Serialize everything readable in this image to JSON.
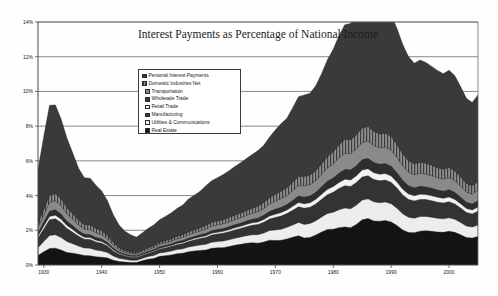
{
  "chart_data": {
    "type": "area",
    "stacked": true,
    "title": "Interest Payments as Percentage of National Income",
    "xlabel": "",
    "ylabel": "",
    "ylim": [
      0,
      14
    ],
    "xlim": [
      1929,
      2005
    ],
    "ytick_labels": [
      "0%",
      "2%",
      "4%",
      "6%",
      "8%",
      "10%",
      "12%",
      "14%"
    ],
    "ytick_values": [
      0,
      2,
      4,
      6,
      8,
      10,
      12,
      14
    ],
    "xtick_labels": [
      "1930",
      "1940",
      "1950",
      "1960",
      "1970",
      "1980",
      "1990",
      "2000"
    ],
    "xtick_values": [
      1930,
      1940,
      1950,
      1960,
      1970,
      1980,
      1990,
      2000
    ],
    "grid": "horizontal",
    "legend_position": "inside-upper-center",
    "x": [
      1929,
      1930,
      1931,
      1932,
      1933,
      1934,
      1935,
      1936,
      1937,
      1938,
      1939,
      1940,
      1941,
      1942,
      1943,
      1944,
      1945,
      1946,
      1947,
      1948,
      1949,
      1950,
      1951,
      1952,
      1953,
      1954,
      1955,
      1956,
      1957,
      1958,
      1959,
      1960,
      1961,
      1962,
      1963,
      1964,
      1965,
      1966,
      1967,
      1968,
      1969,
      1970,
      1971,
      1972,
      1973,
      1974,
      1975,
      1976,
      1977,
      1978,
      1979,
      1980,
      1981,
      1982,
      1983,
      1984,
      1985,
      1986,
      1987,
      1988,
      1989,
      1990,
      1991,
      1992,
      1993,
      1994,
      1995,
      1996,
      1997,
      1998,
      1999,
      2000,
      2001,
      2002,
      2003,
      2004,
      2005
    ],
    "series": [
      {
        "name": "Real Estate",
        "values": [
          3.1,
          4.2,
          5.2,
          5.1,
          4.6,
          4.0,
          3.5,
          3.0,
          2.7,
          2.7,
          2.5,
          2.3,
          2.0,
          1.6,
          1.3,
          1.1,
          1.0,
          0.9,
          1.0,
          1.1,
          1.2,
          1.3,
          1.4,
          1.5,
          1.6,
          1.7,
          1.9,
          2.0,
          2.1,
          2.3,
          2.4,
          2.5,
          2.6,
          2.7,
          2.8,
          2.9,
          3.0,
          3.1,
          3.2,
          3.3,
          3.5,
          3.7,
          3.9,
          4.0,
          4.3,
          4.6,
          4.7,
          4.7,
          4.9,
          5.2,
          5.6,
          5.9,
          6.3,
          6.6,
          6.7,
          6.9,
          7.1,
          7.2,
          7.1,
          7.0,
          7.1,
          7.0,
          6.7,
          6.3,
          6.0,
          5.8,
          5.9,
          5.8,
          5.7,
          5.6,
          5.5,
          5.6,
          5.5,
          5.2,
          4.9,
          4.8,
          5.0
        ]
      },
      {
        "name": "Utilities & Communications",
        "values": [
          0.25,
          0.32,
          0.4,
          0.42,
          0.4,
          0.36,
          0.32,
          0.28,
          0.26,
          0.26,
          0.24,
          0.22,
          0.19,
          0.15,
          0.12,
          0.1,
          0.09,
          0.08,
          0.09,
          0.1,
          0.11,
          0.12,
          0.13,
          0.14,
          0.15,
          0.16,
          0.17,
          0.18,
          0.19,
          0.21,
          0.22,
          0.23,
          0.24,
          0.25,
          0.26,
          0.27,
          0.28,
          0.3,
          0.32,
          0.34,
          0.36,
          0.4,
          0.43,
          0.45,
          0.48,
          0.52,
          0.55,
          0.56,
          0.58,
          0.61,
          0.65,
          0.7,
          0.75,
          0.8,
          0.8,
          0.82,
          0.84,
          0.84,
          0.82,
          0.8,
          0.8,
          0.78,
          0.74,
          0.7,
          0.66,
          0.63,
          0.63,
          0.62,
          0.6,
          0.59,
          0.58,
          0.58,
          0.56,
          0.53,
          0.5,
          0.48,
          0.5
        ]
      },
      {
        "name": "Manufacturing",
        "values": [
          0.3,
          0.4,
          0.5,
          0.52,
          0.48,
          0.42,
          0.37,
          0.32,
          0.29,
          0.29,
          0.27,
          0.25,
          0.21,
          0.17,
          0.13,
          0.11,
          0.1,
          0.09,
          0.1,
          0.11,
          0.12,
          0.13,
          0.14,
          0.15,
          0.16,
          0.18,
          0.19,
          0.2,
          0.22,
          0.24,
          0.25,
          0.26,
          0.27,
          0.28,
          0.29,
          0.31,
          0.32,
          0.34,
          0.37,
          0.4,
          0.43,
          0.47,
          0.5,
          0.52,
          0.56,
          0.61,
          0.64,
          0.65,
          0.67,
          0.71,
          0.76,
          0.82,
          0.88,
          0.94,
          0.94,
          0.96,
          0.99,
          1.0,
          0.97,
          0.95,
          0.95,
          0.93,
          0.88,
          0.83,
          0.78,
          0.75,
          0.75,
          0.74,
          0.72,
          0.7,
          0.69,
          0.7,
          0.67,
          0.63,
          0.59,
          0.57,
          0.6
        ]
      },
      {
        "name": "Retail Trade",
        "values": [
          0.18,
          0.24,
          0.3,
          0.31,
          0.29,
          0.25,
          0.22,
          0.19,
          0.17,
          0.17,
          0.16,
          0.15,
          0.13,
          0.1,
          0.08,
          0.07,
          0.06,
          0.06,
          0.06,
          0.07,
          0.07,
          0.08,
          0.09,
          0.09,
          0.1,
          0.11,
          0.11,
          0.12,
          0.13,
          0.14,
          0.15,
          0.16,
          0.16,
          0.17,
          0.18,
          0.18,
          0.19,
          0.2,
          0.22,
          0.24,
          0.26,
          0.28,
          0.3,
          0.31,
          0.34,
          0.37,
          0.38,
          0.39,
          0.4,
          0.43,
          0.46,
          0.49,
          0.53,
          0.56,
          0.57,
          0.58,
          0.6,
          0.6,
          0.58,
          0.57,
          0.57,
          0.56,
          0.53,
          0.5,
          0.47,
          0.45,
          0.45,
          0.44,
          0.43,
          0.42,
          0.41,
          0.42,
          0.4,
          0.38,
          0.35,
          0.34,
          0.36
        ]
      },
      {
        "name": "Wholesale Trade",
        "values": [
          0.12,
          0.16,
          0.2,
          0.21,
          0.19,
          0.17,
          0.15,
          0.13,
          0.11,
          0.11,
          0.1,
          0.1,
          0.08,
          0.07,
          0.05,
          0.04,
          0.04,
          0.04,
          0.04,
          0.04,
          0.05,
          0.05,
          0.06,
          0.06,
          0.07,
          0.07,
          0.08,
          0.08,
          0.09,
          0.09,
          0.1,
          0.1,
          0.11,
          0.11,
          0.12,
          0.12,
          0.13,
          0.14,
          0.15,
          0.16,
          0.17,
          0.19,
          0.2,
          0.21,
          0.23,
          0.25,
          0.26,
          0.26,
          0.27,
          0.29,
          0.31,
          0.33,
          0.35,
          0.38,
          0.38,
          0.39,
          0.4,
          0.4,
          0.39,
          0.38,
          0.38,
          0.37,
          0.35,
          0.33,
          0.31,
          0.3,
          0.3,
          0.29,
          0.29,
          0.28,
          0.27,
          0.28,
          0.27,
          0.25,
          0.24,
          0.23,
          0.24
        ]
      },
      {
        "name": "Transportation",
        "values": [
          0.55,
          0.72,
          0.9,
          0.92,
          0.86,
          0.75,
          0.66,
          0.57,
          0.51,
          0.51,
          0.47,
          0.44,
          0.37,
          0.29,
          0.23,
          0.19,
          0.17,
          0.16,
          0.17,
          0.19,
          0.21,
          0.23,
          0.24,
          0.26,
          0.28,
          0.3,
          0.32,
          0.34,
          0.37,
          0.4,
          0.42,
          0.43,
          0.45,
          0.47,
          0.48,
          0.5,
          0.52,
          0.55,
          0.58,
          0.62,
          0.66,
          0.72,
          0.76,
          0.79,
          0.84,
          0.9,
          0.93,
          0.94,
          0.97,
          1.02,
          1.08,
          1.15,
          1.22,
          1.28,
          1.28,
          1.3,
          1.33,
          1.33,
          1.29,
          1.26,
          1.26,
          1.23,
          1.16,
          1.09,
          1.03,
          0.99,
          0.99,
          0.97,
          0.95,
          0.93,
          0.91,
          0.92,
          0.88,
          0.83,
          0.78,
          0.75,
          0.79
        ]
      },
      {
        "name": "Domestic Industries Net",
        "values": [
          0.45,
          0.6,
          0.75,
          0.77,
          0.72,
          0.63,
          0.55,
          0.47,
          0.43,
          0.43,
          0.39,
          0.36,
          0.31,
          0.24,
          0.19,
          0.16,
          0.14,
          0.13,
          0.14,
          0.16,
          0.17,
          0.19,
          0.2,
          0.22,
          0.24,
          0.25,
          0.27,
          0.29,
          0.31,
          0.33,
          0.35,
          0.36,
          0.38,
          0.39,
          0.4,
          0.42,
          0.44,
          0.46,
          0.49,
          0.52,
          0.56,
          0.61,
          0.64,
          0.67,
          0.71,
          0.76,
          0.79,
          0.8,
          0.82,
          0.87,
          0.92,
          0.98,
          1.04,
          1.09,
          1.09,
          1.11,
          1.13,
          1.13,
          1.1,
          1.07,
          1.07,
          1.05,
          0.99,
          0.93,
          0.88,
          0.84,
          0.84,
          0.83,
          0.81,
          0.79,
          0.78,
          0.78,
          0.75,
          0.71,
          0.66,
          0.64,
          0.67
        ]
      },
      {
        "name": "Personal Interest Payments",
        "values": [
          0.55,
          0.76,
          0.95,
          0.97,
          0.86,
          0.72,
          0.68,
          0.62,
          0.55,
          0.53,
          0.47,
          0.45,
          0.41,
          0.28,
          0.2,
          0.17,
          0.14,
          0.14,
          0.24,
          0.33,
          0.38,
          0.5,
          0.54,
          0.58,
          0.65,
          0.68,
          0.76,
          0.81,
          0.84,
          0.86,
          0.96,
          0.99,
          1.0,
          1.06,
          1.14,
          1.19,
          1.25,
          1.28,
          1.26,
          1.32,
          1.43,
          1.41,
          1.42,
          1.5,
          1.6,
          1.69,
          1.55,
          1.59,
          1.73,
          1.9,
          2.05,
          2.06,
          2.15,
          2.19,
          2.15,
          2.34,
          2.61,
          2.68,
          2.54,
          2.52,
          2.56,
          2.48,
          2.28,
          2.02,
          1.87,
          1.86,
          1.95,
          1.97,
          1.94,
          1.9,
          1.88,
          1.94,
          1.88,
          1.74,
          1.58,
          1.55,
          1.64
        ]
      }
    ]
  },
  "legend": {
    "items": [
      {
        "label": "Personal Interest Payments",
        "swatch": "dark-solid"
      },
      {
        "label": "Domestic Industries Net",
        "swatch": "hatched"
      },
      {
        "label": "Transportation",
        "swatch": "mid-gray"
      },
      {
        "label": "Wholesale Trade",
        "swatch": "dark-solid"
      },
      {
        "label": "Retail Trade",
        "swatch": "light"
      },
      {
        "label": "Manufacturing",
        "swatch": "dark-solid"
      },
      {
        "label": "Utilities & Communications",
        "swatch": "light"
      },
      {
        "label": "Real Estate",
        "swatch": "black-solid"
      }
    ]
  },
  "colors": {
    "personal_interest_payments": "#3a3a3a",
    "domestic_industries_net": "#6e6e6e",
    "transportation": "#8a8a8a",
    "wholesale_trade": "#2e2e2e",
    "retail_trade": "#f2f2f2",
    "manufacturing": "#333333",
    "utilities_communications": "#ededed",
    "real_estate": "#141414",
    "axis": "#4a4a4a",
    "grid": "#6b6b6b",
    "background": "#fefefe"
  }
}
